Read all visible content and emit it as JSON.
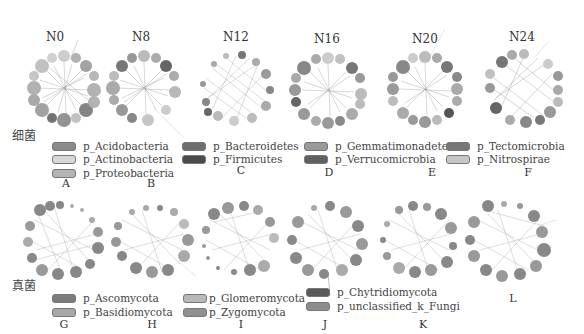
{
  "figure": {
    "row1_group": "细菌",
    "row2_group": "真菌",
    "row1_titles": [
      "N0",
      "N8",
      "N12",
      "N16",
      "N20",
      "N24"
    ],
    "row1_panels": [
      "A",
      "B",
      "C",
      "D",
      "E",
      "F"
    ],
    "row2_panels": [
      "G",
      "H",
      "I",
      "J",
      "K",
      "L"
    ],
    "bacteria_legend": [
      {
        "label": "p_Acidobacteria",
        "color": "#8a8a8a"
      },
      {
        "label": "p_Actinobacteria",
        "color": "#d8d8d8"
      },
      {
        "label": "p_Proteobacteria",
        "color": "#b4b4b4"
      },
      {
        "label": "p_Bacteroidetes",
        "color": "#6e6e6e"
      },
      {
        "label": "p_Firmicutes",
        "color": "#4a4a4a"
      },
      {
        "label": "p_Gemmatimonadetes",
        "color": "#9a9a9a"
      },
      {
        "label": "p_Verrucomicrobia",
        "color": "#606060"
      },
      {
        "label": "p_Tectomicrobia",
        "color": "#767676"
      },
      {
        "label": "p_Nitrospirae",
        "color": "#c6c6c6"
      }
    ],
    "fungi_legend": [
      {
        "label": "p_Ascomycota",
        "color": "#7c7c7c"
      },
      {
        "label": "p_Basidiomycota",
        "color": "#a8a8a8"
      },
      {
        "label": "p_Glomeromycota",
        "color": "#b8b8b8"
      },
      {
        "label": "p_Zygomycota",
        "color": "#909090"
      },
      {
        "label": "p_Chytridiomycota",
        "color": "#5a5a5a"
      },
      {
        "label": "p_unclassified_k_Fungi",
        "color": "#8e8e8e"
      }
    ]
  }
}
